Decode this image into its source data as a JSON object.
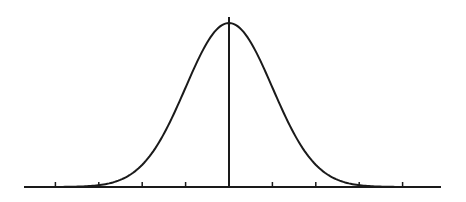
{
  "chart_data": {
    "type": "line",
    "title": "",
    "subtitle": "",
    "xlabel": "",
    "ylabel": "",
    "series": [
      {
        "name": "normal distribution",
        "function": "exp(-x^2/2)",
        "x": [
          -4,
          -3.5,
          -3,
          -2.5,
          -2,
          -1.5,
          -1,
          -0.5,
          0,
          0.5,
          1,
          1.5,
          2,
          2.5,
          3,
          3.5,
          4
        ],
        "values": [
          0.0003,
          0.0022,
          0.0111,
          0.0439,
          0.1353,
          0.3247,
          0.6065,
          0.8825,
          1.0,
          0.8825,
          0.6065,
          0.3247,
          0.1353,
          0.0439,
          0.0111,
          0.0022,
          0.0003
        ]
      }
    ],
    "x_ticks": [
      -4,
      -3,
      -2,
      -1,
      0,
      1,
      2,
      3,
      4
    ],
    "tick_labels": [],
    "mean_line": {
      "x": 0
    },
    "xlim": [
      -4.3,
      4.9
    ],
    "ylim": [
      0,
      1.05
    ],
    "grid": false,
    "legend": null,
    "colors": {
      "curve": "#1a1a1a",
      "axis": "#1a1a1a",
      "background": "#ffffff"
    }
  }
}
